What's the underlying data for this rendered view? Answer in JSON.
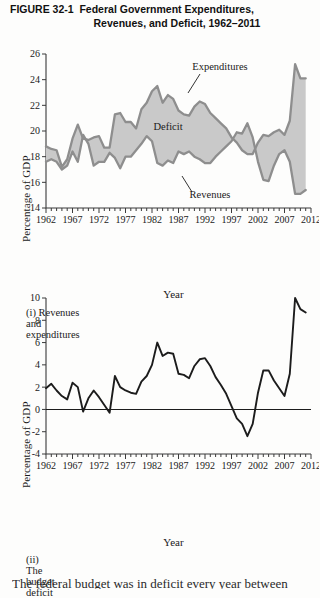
{
  "figure": {
    "label": "FIGURE 32-1",
    "title_line1": "Federal Government Expenditures,",
    "title_line2": "Revenues, and Deficit, 1962–2011"
  },
  "panel1": {
    "caption": "(i) Revenues and expenditures",
    "ylabel": "Percentage of GDP",
    "xlabel": "Year",
    "annotations": {
      "expenditures": "Expenditures",
      "deficit": "Deficit",
      "revenues": "Revenues"
    }
  },
  "panel2": {
    "caption": "(ii) The budget deficit",
    "ylabel": "Percentage of GDP",
    "xlabel": "Year"
  },
  "body_text": "The federal budget was in deficit every year between 1971",
  "colors": {
    "fill": "#c9c9c9",
    "series_line": "#8e8e8e",
    "deficit_line": "#1c1c1c",
    "axis": "#3a3a3a",
    "background": "#fdfdfc"
  },
  "chart_data": [
    {
      "type": "area",
      "title": "(i) Revenues and expenditures",
      "xlabel": "Year",
      "ylabel": "Percentage of GDP",
      "xlim": [
        1962,
        2012
      ],
      "ylim": [
        14,
        26
      ],
      "yticks": [
        14,
        16,
        18,
        20,
        22,
        24,
        26
      ],
      "xticks": [
        1962,
        1967,
        1972,
        1977,
        1982,
        1987,
        1992,
        1997,
        2002,
        2007,
        2012
      ],
      "grid": false,
      "legend": "inline-annotations",
      "annotations": [
        "Expenditures",
        "Deficit",
        "Revenues"
      ],
      "x": [
        1962,
        1963,
        1964,
        1965,
        1966,
        1967,
        1968,
        1969,
        1970,
        1971,
        1972,
        1973,
        1974,
        1975,
        1976,
        1977,
        1978,
        1979,
        1980,
        1981,
        1982,
        1983,
        1984,
        1985,
        1986,
        1987,
        1988,
        1989,
        1990,
        1991,
        1992,
        1993,
        1994,
        1995,
        1996,
        1997,
        1998,
        1999,
        2000,
        2001,
        2002,
        2003,
        2004,
        2005,
        2006,
        2007,
        2008,
        2009,
        2010,
        2011
      ],
      "series": [
        {
          "name": "Expenditures",
          "values": [
            18.8,
            18.6,
            18.5,
            17.2,
            17.8,
            19.4,
            20.5,
            19.4,
            19.3,
            19.5,
            19.6,
            18.7,
            18.7,
            21.3,
            21.4,
            20.7,
            20.7,
            20.2,
            21.7,
            22.2,
            23.1,
            23.5,
            22.2,
            22.8,
            22.5,
            21.6,
            21.3,
            21.2,
            21.9,
            22.3,
            22.1,
            21.4,
            21.0,
            20.6,
            20.2,
            19.5,
            19.1,
            18.5,
            18.2,
            18.2,
            19.1,
            19.7,
            19.6,
            19.9,
            20.1,
            19.7,
            20.8,
            25.2,
            24.1,
            24.1
          ]
        },
        {
          "name": "Revenues",
          "values": [
            17.6,
            17.8,
            17.6,
            17.0,
            17.3,
            18.4,
            17.6,
            19.7,
            19.0,
            17.3,
            17.6,
            17.6,
            18.3,
            17.9,
            17.1,
            18.0,
            18.0,
            18.5,
            19.0,
            19.6,
            19.2,
            17.5,
            17.3,
            17.7,
            17.5,
            18.4,
            18.2,
            18.4,
            18.0,
            17.8,
            17.5,
            17.5,
            18.0,
            18.4,
            18.8,
            19.2,
            19.9,
            19.8,
            20.6,
            19.5,
            17.6,
            16.2,
            16.1,
            17.3,
            18.2,
            18.5,
            17.6,
            15.1,
            15.1,
            15.4
          ]
        }
      ]
    },
    {
      "type": "line",
      "title": "(ii) The budget deficit",
      "xlabel": "Year",
      "ylabel": "Percentage of GDP",
      "xlim": [
        1962,
        2012
      ],
      "ylim": [
        -4,
        10
      ],
      "yticks": [
        -4,
        -2,
        0,
        2,
        4,
        6,
        8,
        10
      ],
      "xticks": [
        1962,
        1967,
        1972,
        1977,
        1982,
        1987,
        1992,
        1997,
        2002,
        2007,
        2012
      ],
      "grid": false,
      "zero_reference_line": 0,
      "series": [
        {
          "name": "Budget deficit",
          "values": [
            1.9,
            2.3,
            1.7,
            1.2,
            0.9,
            2.4,
            2.0,
            -0.2,
            1.0,
            1.7,
            1.1,
            0.4,
            -0.3,
            3.0,
            2.0,
            1.7,
            1.5,
            1.4,
            2.5,
            3.0,
            4.0,
            6.0,
            4.8,
            5.1,
            5.0,
            3.2,
            3.1,
            2.8,
            3.9,
            4.5,
            4.6,
            3.9,
            2.9,
            2.2,
            1.4,
            0.3,
            -0.8,
            -1.3,
            -2.4,
            -1.3,
            1.5,
            3.5,
            3.5,
            2.6,
            1.9,
            1.2,
            3.2,
            10.1,
            9.0,
            8.7
          ]
        }
      ]
    }
  ]
}
